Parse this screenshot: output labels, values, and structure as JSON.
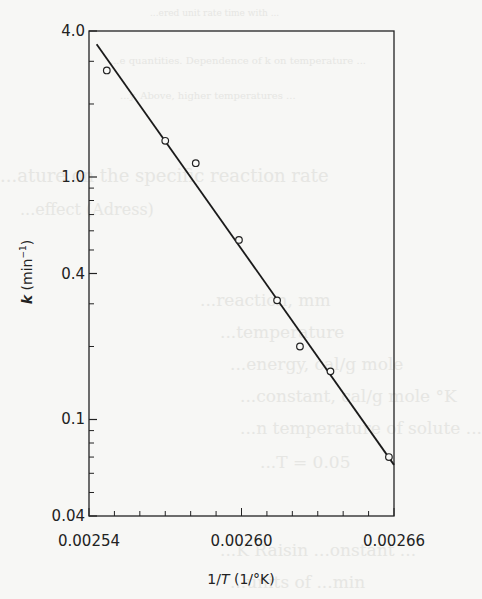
{
  "chart_data": {
    "type": "scatter",
    "title": "",
    "xlabel": "1/T (1/°K)",
    "ylabel": "k (min⁻¹)",
    "xlabel_parts": {
      "pre": "1/",
      "italic": "T",
      "post": " (1/°K)"
    },
    "ylabel_parts": {
      "italic": "k",
      "post": " (min",
      "sup": "−1",
      "close": ")"
    },
    "x_scale": "linear",
    "y_scale": "log",
    "xlim": [
      0.00254,
      0.00266
    ],
    "ylim": [
      0.04,
      4.0
    ],
    "x_tick_labels": [
      "0.00254",
      "0.00260",
      "0.00266"
    ],
    "x_tick_values": [
      0.00254,
      0.0026,
      0.00266
    ],
    "x_minor_step": 1e-05,
    "y_tick_labels": [
      "0.04",
      "0.1",
      "0.4",
      "1.0",
      "4.0"
    ],
    "y_tick_values": [
      0.04,
      0.1,
      0.4,
      1.0,
      4.0
    ],
    "y_minor_values": [
      0.05,
      0.06,
      0.07,
      0.08,
      0.09,
      0.2,
      0.3,
      0.5,
      0.6,
      0.7,
      0.8,
      0.9,
      2.0,
      3.0
    ],
    "grid": false,
    "legend": null,
    "series": [
      {
        "name": "measured",
        "marker": "open-circle",
        "x": [
          0.002547,
          0.00257,
          0.002582,
          0.002599,
          0.002614,
          0.002623,
          0.002635,
          0.002658
        ],
        "y": [
          2.75,
          1.41,
          1.14,
          0.55,
          0.31,
          0.2,
          0.158,
          0.07
        ]
      },
      {
        "name": "fit",
        "style": "line",
        "x": [
          0.002543,
          0.00266
        ],
        "y": [
          3.53,
          0.065
        ]
      }
    ]
  },
  "bleed_through_text": [
    "...ered unit rate time with ...",
    "...e quantities. Dependence of k on temperature ...",
    "...y. Above, higher temperatures ...",
    "...ature on the specific reaction rate",
    "...effect (Adress)",
    "...reaction, mm",
    "...temperature",
    "...energy, cal/g mole",
    "...constant, cal/g mole °K",
    "...n temperature of solute ...",
    "...T = 0.05",
    "...K Raisin ...onstant ...",
    "...units of ...min"
  ]
}
